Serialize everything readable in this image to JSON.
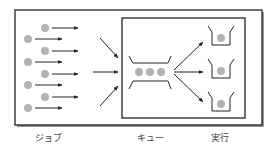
{
  "diagram": {
    "type": "job-queue-flow",
    "labels": {
      "jobs": "ジョブ",
      "queue": "キュー",
      "execution": "実行"
    },
    "jobs_count": 8,
    "queue_items": 3,
    "executors": 3,
    "colors": {
      "dot": "#b3b3b3",
      "line": "#222222",
      "shadow": "#888888",
      "background": "#ffffff"
    }
  }
}
